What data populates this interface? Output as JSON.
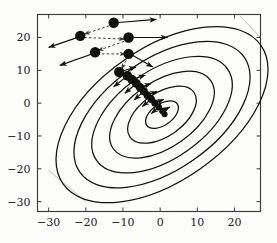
{
  "figure": {
    "name": "gradient-descent-contour-plot",
    "background_color": "#fdfdfc",
    "ink_color": "#111111",
    "artifact_color": "#b9b9b9"
  },
  "chart_data": {
    "type": "scatter",
    "title": "",
    "xlabel": "",
    "ylabel": "",
    "xlim": [
      -33,
      27
    ],
    "ylim": [
      -33,
      27
    ],
    "grid": false,
    "legend": null,
    "xticks": [
      -30,
      -20,
      -10,
      0,
      10,
      20
    ],
    "yticks": [
      20,
      10,
      0,
      -10,
      -20,
      -30
    ],
    "xtick_labels": [
      "−30",
      "−20",
      "−10",
      "0",
      "10",
      "20"
    ],
    "ytick_labels": [
      "20",
      "10",
      "0",
      "−10",
      "−20",
      "−30"
    ],
    "contours": {
      "description": "nested tilted elliptical level sets of a quadratic objective",
      "center": [
        0.5,
        -3.5
      ],
      "rotation_deg": -35,
      "count": 6,
      "levels": [
        1,
        2,
        3,
        4,
        5,
        6
      ],
      "semi_axes": [
        [
          5.0,
          3.2
        ],
        [
          10.5,
          6.6
        ],
        [
          16.0,
          10.0
        ],
        [
          21.5,
          13.4
        ],
        [
          27.0,
          16.8
        ],
        [
          32.5,
          20.2
        ]
      ]
    },
    "series": [
      {
        "name": "iterates",
        "marker": "filled-circle",
        "values": [
          [
            -12.5,
            24.5
          ],
          [
            -21.5,
            20.5
          ],
          [
            -8.5,
            20.0
          ],
          [
            -17.5,
            15.5
          ],
          [
            -8.5,
            15.0
          ],
          [
            -11.0,
            9.5
          ],
          [
            -8.8,
            8.3
          ],
          [
            -7.6,
            7.2
          ],
          [
            -6.4,
            6.0
          ],
          [
            -5.4,
            4.8
          ],
          [
            -4.4,
            3.6
          ],
          [
            -3.4,
            2.4
          ],
          [
            -2.4,
            1.2
          ],
          [
            -1.4,
            0.0
          ],
          [
            -0.4,
            -1.2
          ],
          [
            0.6,
            -2.4
          ],
          [
            1.2,
            -3.4
          ]
        ]
      },
      {
        "name": "gradient-step-arrows",
        "style": "solid",
        "arrows": [
          {
            "from": [
              -12.0,
              24.5
            ],
            "to": [
              -1.0,
              25.5
            ]
          },
          {
            "from": [
              -21.0,
              20.5
            ],
            "to": [
              -30.0,
              17.0
            ]
          },
          {
            "from": [
              -8.0,
              20.0
            ],
            "to": [
              2.0,
              20.0
            ]
          },
          {
            "from": [
              -17.0,
              15.5
            ],
            "to": [
              -27.0,
              11.5
            ]
          },
          {
            "from": [
              -8.0,
              15.0
            ],
            "to": [
              -2.0,
              11.0
            ]
          },
          {
            "from": [
              -11.0,
              9.5
            ],
            "to": [
              -6.5,
              11.0
            ]
          },
          {
            "from": [
              -8.8,
              8.3
            ],
            "to": [
              -12.5,
              5.0
            ]
          },
          {
            "from": [
              -7.6,
              7.2
            ],
            "to": [
              -4.0,
              8.5
            ]
          },
          {
            "from": [
              -6.4,
              6.0
            ],
            "to": [
              -9.5,
              3.0
            ]
          },
          {
            "from": [
              -5.4,
              4.8
            ],
            "to": [
              -2.4,
              6.0
            ]
          },
          {
            "from": [
              -4.4,
              3.6
            ],
            "to": [
              -7.0,
              1.0
            ]
          },
          {
            "from": [
              -3.4,
              2.4
            ],
            "to": [
              -0.8,
              3.6
            ]
          },
          {
            "from": [
              -2.4,
              1.2
            ],
            "to": [
              -4.8,
              -1.0
            ]
          },
          {
            "from": [
              -1.4,
              0.0
            ],
            "to": [
              1.0,
              1.2
            ]
          },
          {
            "from": [
              -0.4,
              -1.2
            ],
            "to": [
              -2.4,
              -3.2
            ]
          },
          {
            "from": [
              0.6,
              -2.4
            ],
            "to": [
              2.6,
              -1.2
            ]
          }
        ]
      },
      {
        "name": "conjugate-direction-arrows",
        "style": "dashed",
        "arrows": [
          {
            "from": [
              -12.5,
              24.0
            ],
            "to": [
              -20.5,
              21.0
            ]
          },
          {
            "from": [
              -20.5,
              20.0
            ],
            "to": [
              -9.5,
              19.5
            ]
          },
          {
            "from": [
              -8.5,
              19.3
            ],
            "to": [
              -16.8,
              16.0
            ]
          },
          {
            "from": [
              -17.0,
              15.0
            ],
            "to": [
              -9.3,
              15.0
            ]
          },
          {
            "from": [
              -8.5,
              14.3
            ],
            "to": [
              -10.5,
              10.3
            ]
          }
        ]
      }
    ],
    "scan_artifacts": [
      {
        "name": "top-right-fold-line",
        "from": [
          21.5,
          26.5
        ],
        "to": [
          27.0,
          20.0
        ]
      },
      {
        "name": "bottom-left-fold-line",
        "from": [
          -30.0,
          -20.5
        ],
        "to": [
          -20.0,
          -30.0
        ]
      }
    ]
  }
}
